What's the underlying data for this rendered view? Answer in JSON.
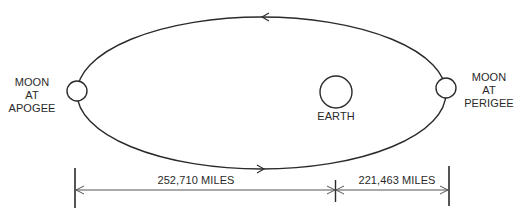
{
  "diagram": {
    "colors": {
      "stroke": "#2a2a2a",
      "background": "#ffffff",
      "text": "#2a2a2a"
    },
    "orbit": {
      "shape": "ellipse",
      "direction": "counterclockwise",
      "top_arrow": "arrow-left",
      "bottom_arrow": "arrow-right"
    },
    "bodies": {
      "earth": {
        "label": "EARTH"
      },
      "moon_apogee": {
        "label_lines": [
          "MOON",
          "AT",
          "APOGEE"
        ]
      },
      "moon_perigee": {
        "label_lines": [
          "MOON",
          "AT",
          "PERIGEE"
        ]
      }
    },
    "dimensions": {
      "apogee_distance": {
        "label": "252,710 MILES",
        "value": 252710,
        "unit": "MILES"
      },
      "perigee_distance": {
        "label": "221,463 MILES",
        "value": 221463,
        "unit": "MILES"
      }
    }
  }
}
